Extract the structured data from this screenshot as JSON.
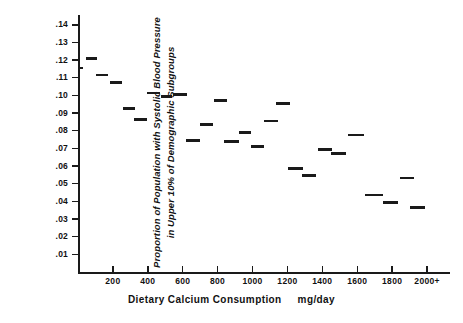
{
  "chart_data": {
    "type": "bar",
    "title": "",
    "subtitle": "",
    "xlabel": "Dietary Calcium Consumption",
    "xunits": "mg/day",
    "ylabel_line1": "Proportion of Population with Systolic Blood Pressure",
    "ylabel_line2": "in Upper 10% of Demographic Subgroups",
    "xlim": [
      0,
      2120
    ],
    "ylim": [
      0,
      0.145
    ],
    "grid": false,
    "legend": null,
    "xticks": [
      200,
      400,
      600,
      800,
      1000,
      1200,
      1400,
      1600,
      1800,
      2000
    ],
    "xtick_labels": [
      "200",
      "400",
      "600",
      "800",
      "1000",
      "1200",
      "1400",
      "1600",
      "1800",
      "2000+"
    ],
    "yticks": [
      0.01,
      0.02,
      0.03,
      0.04,
      0.05,
      0.06,
      0.07,
      0.08,
      0.09,
      0.1,
      0.11,
      0.12,
      0.13,
      0.14
    ],
    "ytick_labels": [
      ".01",
      ".02",
      ".03",
      ".04",
      ".05",
      ".06",
      ".07",
      ".08",
      ".09",
      ".10",
      ".11",
      ".12",
      ".13",
      ".14"
    ],
    "marker_style": "horizontal-bin-segment",
    "color": "#1a1a1a",
    "segments": [
      {
        "x_start": 0,
        "x_end": 30,
        "value": 0.1155
      },
      {
        "x_start": 45,
        "x_end": 110,
        "value": 0.121
      },
      {
        "x_start": 105,
        "x_end": 170,
        "value": 0.1115
      },
      {
        "x_start": 182,
        "x_end": 250,
        "value": 0.1075
      },
      {
        "x_start": 255,
        "x_end": 327,
        "value": 0.0925
      },
      {
        "x_start": 318,
        "x_end": 396,
        "value": 0.0865
      },
      {
        "x_start": 396,
        "x_end": 469,
        "value": 0.1015
      },
      {
        "x_start": 473,
        "x_end": 536,
        "value": 0.0995
      },
      {
        "x_start": 542,
        "x_end": 627,
        "value": 0.1005
      },
      {
        "x_start": 618,
        "x_end": 700,
        "value": 0.0745
      },
      {
        "x_start": 700,
        "x_end": 773,
        "value": 0.0835
      },
      {
        "x_start": 778,
        "x_end": 851,
        "value": 0.097
      },
      {
        "x_start": 836,
        "x_end": 923,
        "value": 0.074
      },
      {
        "x_start": 923,
        "x_end": 991,
        "value": 0.079
      },
      {
        "x_start": 991,
        "x_end": 1063,
        "value": 0.071
      },
      {
        "x_start": 1063,
        "x_end": 1145,
        "value": 0.0855
      },
      {
        "x_start": 1136,
        "x_end": 1214,
        "value": 0.0955
      },
      {
        "x_start": 1205,
        "x_end": 1291,
        "value": 0.0585
      },
      {
        "x_start": 1281,
        "x_end": 1363,
        "value": 0.0545
      },
      {
        "x_start": 1376,
        "x_end": 1454,
        "value": 0.0695
      },
      {
        "x_start": 1450,
        "x_end": 1536,
        "value": 0.0672
      },
      {
        "x_start": 1545,
        "x_end": 1636,
        "value": 0.0775
      },
      {
        "x_start": 1645,
        "x_end": 1745,
        "value": 0.0435
      },
      {
        "x_start": 1745,
        "x_end": 1832,
        "value": 0.0395
      },
      {
        "x_start": 1845,
        "x_end": 1923,
        "value": 0.0533
      },
      {
        "x_start": 1905,
        "x_end": 1991,
        "value": 0.0365
      }
    ]
  }
}
